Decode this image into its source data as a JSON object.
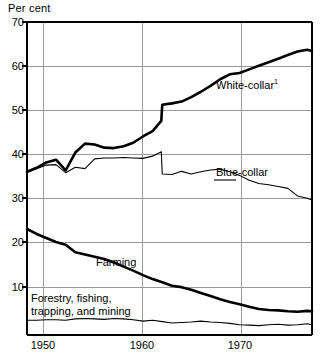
{
  "chart_data": {
    "type": "line",
    "title": "",
    "ylabel": "Per cent",
    "xlabel": "",
    "ylim": [
      0,
      70
    ],
    "xlim": [
      1946,
      1975.5
    ],
    "yticks": [
      10,
      20,
      30,
      40,
      50,
      60,
      70
    ],
    "ytick_labels": [
      "10",
      "20",
      "30",
      "40",
      "50",
      "60",
      "70"
    ],
    "xticks": [
      1950,
      1960,
      1970
    ],
    "xtick_labels": [
      "1950",
      "1960",
      "1970"
    ],
    "grid": "both",
    "legend_position": "inline-annotations",
    "series": [
      {
        "name": "White-collar",
        "label": "White-collar",
        "label_superscript": "1",
        "linewidth": "thick",
        "color": "#000000",
        "x": [
          1946,
          1947,
          1948,
          1949,
          1950,
          1951,
          1952,
          1953,
          1954,
          1955,
          1956,
          1957,
          1958,
          1959,
          1959.9,
          1960,
          1961,
          1962,
          1963,
          1964,
          1965,
          1966,
          1967,
          1968,
          1969,
          1970,
          1971,
          1972,
          1973,
          1974,
          1975,
          1975.5
        ],
        "values": [
          36.5,
          37.4,
          38.6,
          39.2,
          36.8,
          40.8,
          42.8,
          42.6,
          41.9,
          41.8,
          42.2,
          43.0,
          44.4,
          45.6,
          47.9,
          51.5,
          51.8,
          52.2,
          53.2,
          54.4,
          55.7,
          57.2,
          58.3,
          58.6,
          59.4,
          60.2,
          61.0,
          61.8,
          62.6,
          63.4,
          63.8,
          63.5
        ]
      },
      {
        "name": "Blue-collar",
        "label": "Blue-collar",
        "linewidth": "thin",
        "color": "#000000",
        "x": [
          1946,
          1947,
          1948,
          1949,
          1950,
          1951,
          1952,
          1953,
          1954,
          1955,
          1956,
          1957,
          1958,
          1959,
          1959.9,
          1960,
          1961,
          1962,
          1963,
          1964,
          1965,
          1966,
          1967,
          1968,
          1969,
          1970,
          1971,
          1972,
          1973,
          1974,
          1975,
          1975.5
        ],
        "values": [
          36.4,
          37.2,
          38.0,
          38.1,
          36.3,
          37.5,
          37.2,
          39.4,
          39.6,
          39.6,
          39.7,
          39.6,
          39.5,
          40.0,
          41.0,
          36.0,
          35.9,
          36.6,
          36.0,
          36.5,
          36.9,
          37.1,
          36.5,
          35.7,
          34.6,
          33.9,
          33.6,
          33.2,
          32.8,
          31.1,
          30.6,
          30.2
        ]
      },
      {
        "name": "Farming",
        "label": "Farming",
        "linewidth": "thick",
        "color": "#000000",
        "x": [
          1946,
          1947,
          1948,
          1949,
          1950,
          1951,
          1952,
          1953,
          1954,
          1955,
          1956,
          1957,
          1958,
          1959,
          1960,
          1961,
          1962,
          1963,
          1964,
          1965,
          1966,
          1967,
          1968,
          1969,
          1970,
          1971,
          1972,
          1973,
          1974,
          1975,
          1975.5
        ],
        "values": [
          23.7,
          22.6,
          21.7,
          20.8,
          20.2,
          18.5,
          18.0,
          17.5,
          17.0,
          16.2,
          15.3,
          14.4,
          13.4,
          12.5,
          11.8,
          11.0,
          10.7,
          10.1,
          9.4,
          8.7,
          8.0,
          7.4,
          6.9,
          6.3,
          5.8,
          5.6,
          5.5,
          5.3,
          5.2,
          5.4,
          5.3
        ]
      },
      {
        "name": "Forestry, fishing, trapping, and mining",
        "label": "Forestry, fishing, trapping, and mining",
        "linewidth": "thin",
        "color": "#000000",
        "x": [
          1946,
          1947,
          1948,
          1949,
          1950,
          1951,
          1952,
          1953,
          1954,
          1955,
          1956,
          1957,
          1958,
          1959,
          1960,
          1961,
          1962,
          1963,
          1964,
          1965,
          1966,
          1967,
          1968,
          1969,
          1970,
          1971,
          1972,
          1973,
          1974,
          1975,
          1975.5
        ],
        "values": [
          3.3,
          3.3,
          3.4,
          3.4,
          3.3,
          3.6,
          3.7,
          3.6,
          3.5,
          3.7,
          3.6,
          3.4,
          3.1,
          3.3,
          3.0,
          2.7,
          2.8,
          2.9,
          3.1,
          2.9,
          2.8,
          2.6,
          2.3,
          2.2,
          2.1,
          2.3,
          2.4,
          2.2,
          2.3,
          2.5,
          2.3
        ]
      }
    ],
    "annotations": [
      {
        "text": "White-collar",
        "superscript": "1"
      },
      {
        "text": "Blue-collar"
      },
      {
        "text": "Farming"
      },
      {
        "text": "Forestry, fishing,"
      },
      {
        "text": "trapping, and mining"
      }
    ]
  },
  "labels": {
    "axis_title": "Per cent",
    "white_collar": "White-collar",
    "white_collar_sup": "1",
    "blue_collar": "Blue-collar",
    "farming": "Farming",
    "forestry_line1": "Forestry, fishing,",
    "forestry_line2": "trapping, and mining"
  },
  "yticks": {
    "t70": "70",
    "t60": "60",
    "t50": "50",
    "t40": "40",
    "t30": "30",
    "t20": "20",
    "t10": "10"
  },
  "xticks": {
    "t1950": "1950",
    "t1960": "1960",
    "t1970": "1970"
  },
  "colors": {
    "ink": "#000000",
    "grid": "#9a9a9a",
    "background": "#ffffff"
  }
}
